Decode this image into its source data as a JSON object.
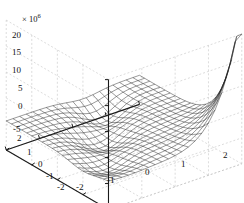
{
  "figure": {
    "background": "#ffffff",
    "axis_color": "#1a1a1a",
    "grid_color": "#b9b9b9",
    "mesh_color": "#1c1c1c",
    "exponent_prefix": "× 10",
    "exponent_power": "6"
  },
  "chart_data": {
    "type": "line",
    "render": "3d-mesh-surface",
    "title": "",
    "subtitle": "",
    "xlabel": "",
    "ylabel": "",
    "zlabel": "",
    "z_exponent": 6,
    "z_scale_label": "× 10⁶",
    "grid": true,
    "legend": null,
    "xlim": [
      -2,
      2
    ],
    "ylim": [
      -2,
      2
    ],
    "zlim": [
      -5,
      20
    ],
    "x_ticks": [
      -2,
      -1,
      0,
      1,
      2
    ],
    "x_ticklabels": [
      "-2",
      "-1",
      "0",
      "1",
      "2"
    ],
    "y_ticks": [
      -2,
      -1,
      0,
      1,
      2
    ],
    "y_ticklabels": [
      "-2",
      "-1",
      "0",
      "1",
      "2"
    ],
    "z_ticks": [
      -5,
      0,
      5,
      10,
      15,
      20
    ],
    "z_ticklabels": [
      "-5",
      "0",
      "5",
      "10",
      "15",
      "20"
    ],
    "mesh_nx": 21,
    "mesh_ny": 21,
    "view_azimuth": -37.5,
    "view_elevation": 30,
    "peak_value": 20,
    "valley_value": -5
  },
  "axes": {
    "z_tick_labels": [
      {
        "text": "20",
        "x": 12,
        "y": 31
      },
      {
        "text": "15",
        "x": 12,
        "y": 48
      },
      {
        "text": "10",
        "x": 12,
        "y": 66
      },
      {
        "text": "5",
        "x": 18,
        "y": 84
      },
      {
        "text": "0",
        "x": 18,
        "y": 102
      },
      {
        "text": "-5",
        "x": 13,
        "y": 125
      }
    ],
    "y_tick_labels": [
      {
        "text": "2",
        "x": 17,
        "y": 134
      },
      {
        "text": "1",
        "x": 27,
        "y": 148
      },
      {
        "text": "0",
        "x": 38,
        "y": 160
      },
      {
        "text": "-1",
        "x": 46,
        "y": 172
      },
      {
        "text": "-2",
        "x": 57,
        "y": 183
      }
    ],
    "x_tick_labels": [
      {
        "text": "-2",
        "x": 76,
        "y": 183
      },
      {
        "text": "-1",
        "x": 107,
        "y": 176
      },
      {
        "text": "0",
        "x": 145,
        "y": 168
      },
      {
        "text": "1",
        "x": 181,
        "y": 160
      },
      {
        "text": "2",
        "x": 223,
        "y": 151
      }
    ]
  }
}
